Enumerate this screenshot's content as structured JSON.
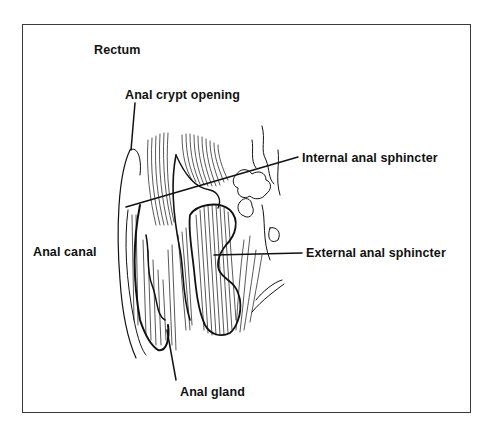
{
  "diagram": {
    "type": "anatomical-illustration",
    "labels": {
      "rectum": "Rectum",
      "anal_crypt_opening": "Anal crypt opening",
      "internal_anal_sphincter": "Internal anal sphincter",
      "anal_canal": "Anal canal",
      "external_anal_sphincter": "External anal sphincter",
      "anal_gland": "Anal gland"
    },
    "colors": {
      "ink": "#111111",
      "background": "#ffffff",
      "frame": "#3a3a3a"
    }
  }
}
